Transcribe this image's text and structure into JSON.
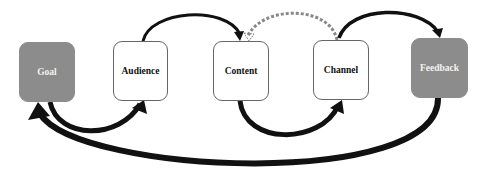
{
  "diagram": {
    "type": "flow-cycle",
    "nodes": [
      {
        "id": "goal",
        "label": "Goal",
        "style": "filled"
      },
      {
        "id": "audience",
        "label": "Audience",
        "style": "outline"
      },
      {
        "id": "content",
        "label": "Content",
        "style": "outline"
      },
      {
        "id": "channel",
        "label": "Channel",
        "style": "outline"
      },
      {
        "id": "feedback",
        "label": "Feedback",
        "style": "filled"
      }
    ],
    "edges": [
      {
        "from": "goal",
        "to": "audience",
        "route": "below",
        "style": "solid"
      },
      {
        "from": "audience",
        "to": "content",
        "route": "above",
        "style": "solid"
      },
      {
        "from": "content",
        "to": "channel",
        "route": "below",
        "style": "solid"
      },
      {
        "from": "channel",
        "to": "content",
        "route": "above",
        "style": "dashed"
      },
      {
        "from": "channel",
        "to": "feedback",
        "route": "above",
        "style": "solid"
      },
      {
        "from": "feedback",
        "to": "goal",
        "route": "below",
        "style": "solid"
      }
    ],
    "colors": {
      "filled_node": "#8c8c8c",
      "outline_border": "#666666",
      "arrow": "#111111",
      "dashed_arrow": "#888888"
    }
  }
}
